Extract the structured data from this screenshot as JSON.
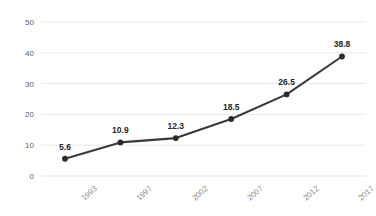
{
  "chart_data": {
    "type": "line",
    "title": "",
    "subtitle": "",
    "xlabel": "",
    "ylabel": "",
    "categories": [
      "1993",
      "1997",
      "2002",
      "2007",
      "2012",
      "2017"
    ],
    "values": [
      5.6,
      10.9,
      12.3,
      18.5,
      26.5,
      38.8
    ],
    "point_labels": [
      "5.6",
      "10.9",
      "12.3",
      "18.5",
      "26.5",
      "38.8"
    ],
    "series": [
      {
        "name": "",
        "values": [
          5.6,
          10.9,
          12.3,
          18.5,
          26.5,
          38.8
        ]
      }
    ],
    "ylim": [
      0,
      50
    ],
    "yticks": [
      0,
      10,
      20,
      30,
      40,
      50
    ],
    "ytick_labels": [
      "0",
      "10",
      "20",
      "30",
      "40",
      "50"
    ],
    "grid": "horizontal",
    "legend": "none",
    "marker": "circle",
    "line_color": "#3a3a3a",
    "marker_color": "#2b2b2b",
    "grid_color": "#e8e8e8",
    "axis_label_color": "#8a8a8a",
    "data_label_color": "#262626"
  },
  "notes": {
    "title_clipped": "chart title cropped off top edge of screenshot"
  }
}
